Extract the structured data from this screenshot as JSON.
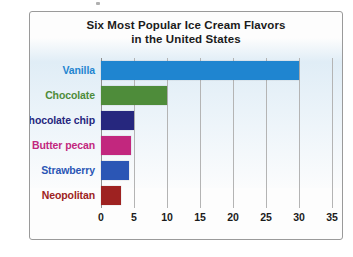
{
  "chart_data": {
    "type": "bar",
    "orientation": "horizontal",
    "title": "Six Most Popular Ice Cream Flavors in the United States",
    "title_line1": "Six Most Popular Ice Cream Flavors",
    "title_line2": "in the United States",
    "xlabel": "",
    "ylabel": "",
    "xlim": [
      0,
      35
    ],
    "xticks": [
      0,
      5,
      10,
      15,
      20,
      25,
      30,
      35
    ],
    "grid": true,
    "legend": false,
    "categories": [
      "Vanilla",
      "Chocolate",
      "Chocolate chip",
      "Butter pecan",
      "Strawberry",
      "Neopolitan"
    ],
    "values": [
      30,
      10,
      5,
      4.5,
      4.3,
      3
    ],
    "bar_colors": [
      "#1f85d0",
      "#4e8c3a",
      "#26277e",
      "#c2277e",
      "#2b56b5",
      "#9e2221"
    ],
    "label_colors": [
      "#1f85d0",
      "#4e8c3a",
      "#26277e",
      "#c2277e",
      "#2b56b5",
      "#9e2221"
    ]
  }
}
